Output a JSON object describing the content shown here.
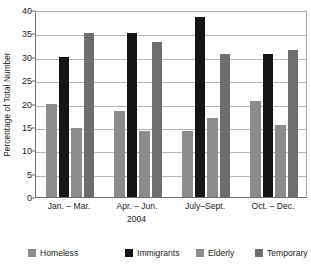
{
  "chart_data": {
    "type": "bar",
    "title": "",
    "xlabel": "2004",
    "ylabel": "Percentage of Total Number",
    "categories": [
      "Jan. – Mar.",
      "Apr. – Jun.",
      "July–Sept.",
      "Oct. – Dec."
    ],
    "series": [
      {
        "name": "Homeless",
        "color": "#8c8c8c",
        "values": [
          20.0,
          18.3,
          14.2,
          20.5
        ]
      },
      {
        "name": "Immigrants",
        "color": "#151515",
        "values": [
          30.0,
          35.0,
          38.5,
          30.5
        ]
      },
      {
        "name": "Elderly",
        "color": "#8c8c8c",
        "values": [
          14.8,
          14.2,
          16.8,
          15.3
        ]
      },
      {
        "name": "Temporary",
        "color": "#6e6e6e",
        "values": [
          35.0,
          33.2,
          30.6,
          31.5
        ]
      }
    ],
    "ylim": [
      0,
      40
    ],
    "yticks": [
      0,
      5,
      10,
      15,
      20,
      25,
      30,
      35,
      40
    ],
    "ytick_labels": [
      "0",
      "5",
      "10",
      "15",
      "20",
      "25",
      "30",
      "35",
      "40"
    ],
    "grid": true,
    "legend_position": "bottom",
    "legend_entries": [
      "Homeless",
      "Immigrants",
      "Elderly",
      "Temporary"
    ]
  }
}
